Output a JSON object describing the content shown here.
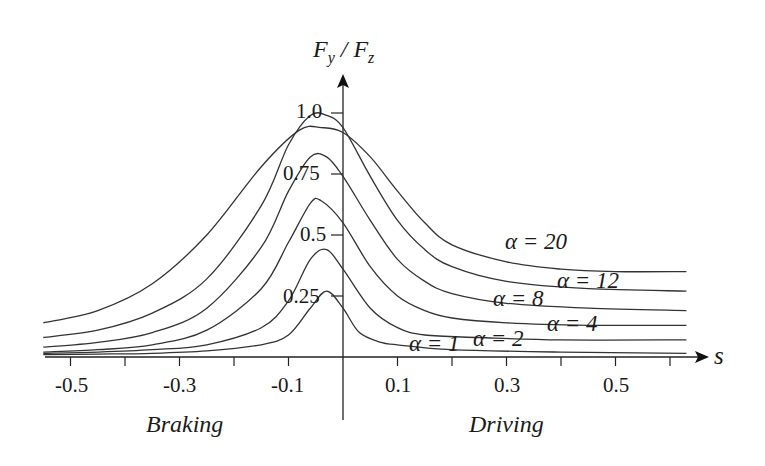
{
  "chart_data": {
    "type": "line",
    "title": "",
    "xlabel": "s",
    "ylabel": "F_y / F_z",
    "xlim": [
      -0.56,
      0.63
    ],
    "ylim": [
      0,
      1.1
    ],
    "grid": false,
    "x_ticks": [
      -0.5,
      -0.4,
      -0.3,
      -0.2,
      -0.1,
      0.1,
      0.2,
      0.3,
      0.4,
      0.5,
      0.6
    ],
    "x_tick_labels": [
      "-0.5",
      "-0.3",
      "-0.1",
      "0.1",
      "0.3",
      "0.5"
    ],
    "y_ticks": [
      0.25,
      0.5,
      0.75,
      1.0
    ],
    "y_tick_labels": [
      "0.25",
      "0.5",
      "0.75",
      "1.0"
    ],
    "region_labels": {
      "left": "Braking",
      "right": "Driving"
    },
    "series": [
      {
        "name": "α = 20",
        "label": "α = 20",
        "points": [
          [
            -0.55,
            0.14
          ],
          [
            -0.45,
            0.19
          ],
          [
            -0.35,
            0.3
          ],
          [
            -0.25,
            0.5
          ],
          [
            -0.15,
            0.78
          ],
          [
            -0.08,
            0.93
          ],
          [
            -0.04,
            0.94
          ],
          [
            0.0,
            0.92
          ],
          [
            0.05,
            0.82
          ],
          [
            0.1,
            0.68
          ],
          [
            0.15,
            0.55
          ],
          [
            0.2,
            0.46
          ],
          [
            0.3,
            0.39
          ],
          [
            0.4,
            0.36
          ],
          [
            0.5,
            0.35
          ],
          [
            0.63,
            0.35
          ]
        ]
      },
      {
        "name": "α = 12",
        "label": "α = 12",
        "points": [
          [
            -0.55,
            0.08
          ],
          [
            -0.45,
            0.11
          ],
          [
            -0.35,
            0.18
          ],
          [
            -0.25,
            0.32
          ],
          [
            -0.15,
            0.62
          ],
          [
            -0.1,
            0.87
          ],
          [
            -0.06,
            0.99
          ],
          [
            -0.03,
            0.99
          ],
          [
            0.0,
            0.94
          ],
          [
            0.05,
            0.74
          ],
          [
            0.1,
            0.56
          ],
          [
            0.15,
            0.44
          ],
          [
            0.2,
            0.37
          ],
          [
            0.3,
            0.31
          ],
          [
            0.45,
            0.28
          ],
          [
            0.63,
            0.27
          ]
        ]
      },
      {
        "name": "α = 8",
        "label": "α = 8",
        "points": [
          [
            -0.55,
            0.04
          ],
          [
            -0.45,
            0.06
          ],
          [
            -0.35,
            0.1
          ],
          [
            -0.25,
            0.2
          ],
          [
            -0.15,
            0.45
          ],
          [
            -0.1,
            0.68
          ],
          [
            -0.06,
            0.82
          ],
          [
            -0.03,
            0.82
          ],
          [
            0.0,
            0.74
          ],
          [
            0.05,
            0.56
          ],
          [
            0.1,
            0.4
          ],
          [
            0.15,
            0.31
          ],
          [
            0.2,
            0.26
          ],
          [
            0.3,
            0.22
          ],
          [
            0.45,
            0.2
          ],
          [
            0.63,
            0.19
          ]
        ]
      },
      {
        "name": "α = 4",
        "label": "α = 4",
        "points": [
          [
            -0.55,
            0.02
          ],
          [
            -0.45,
            0.03
          ],
          [
            -0.35,
            0.05
          ],
          [
            -0.25,
            0.11
          ],
          [
            -0.15,
            0.28
          ],
          [
            -0.1,
            0.47
          ],
          [
            -0.06,
            0.63
          ],
          [
            -0.04,
            0.64
          ],
          [
            0.0,
            0.55
          ],
          [
            0.05,
            0.37
          ],
          [
            0.1,
            0.25
          ],
          [
            0.15,
            0.19
          ],
          [
            0.2,
            0.16
          ],
          [
            0.3,
            0.14
          ],
          [
            0.45,
            0.13
          ],
          [
            0.63,
            0.13
          ]
        ]
      },
      {
        "name": "α = 2",
        "label": "α = 2",
        "points": [
          [
            -0.55,
            0.015
          ],
          [
            -0.45,
            0.02
          ],
          [
            -0.35,
            0.03
          ],
          [
            -0.25,
            0.05
          ],
          [
            -0.15,
            0.12
          ],
          [
            -0.1,
            0.23
          ],
          [
            -0.06,
            0.4
          ],
          [
            -0.03,
            0.44
          ],
          [
            0.0,
            0.36
          ],
          [
            0.05,
            0.2
          ],
          [
            0.1,
            0.12
          ],
          [
            0.15,
            0.09
          ],
          [
            0.25,
            0.08
          ],
          [
            0.4,
            0.07
          ],
          [
            0.63,
            0.07
          ]
        ]
      },
      {
        "name": "α = 1",
        "label": "α = 1",
        "points": [
          [
            -0.55,
            0.01
          ],
          [
            -0.45,
            0.012
          ],
          [
            -0.35,
            0.015
          ],
          [
            -0.25,
            0.025
          ],
          [
            -0.15,
            0.05
          ],
          [
            -0.1,
            0.09
          ],
          [
            -0.06,
            0.2
          ],
          [
            -0.03,
            0.27
          ],
          [
            0.0,
            0.2
          ],
          [
            0.03,
            0.1
          ],
          [
            0.07,
            0.06
          ],
          [
            0.1,
            0.05
          ],
          [
            0.2,
            0.03
          ],
          [
            0.4,
            0.02
          ],
          [
            0.63,
            0.015
          ]
        ]
      }
    ],
    "annotations": [
      {
        "text": "α = 20",
        "x": 0.28,
        "y": 0.47
      },
      {
        "text": "α = 12",
        "x": 0.39,
        "y": 0.3
      },
      {
        "text": "α = 8",
        "x": 0.27,
        "y": 0.23
      },
      {
        "text": "α = 4",
        "x": 0.36,
        "y": 0.12
      },
      {
        "text": "α = 2",
        "x": 0.24,
        "y": 0.08
      },
      {
        "text": "α = 1",
        "x": 0.12,
        "y": 0.05
      }
    ]
  },
  "axis": {
    "y_label_main": "F",
    "y_label_sub1": "y",
    "y_label_sep": " / F",
    "y_label_sub2": "z",
    "x_label": "s"
  },
  "ticks": {
    "x": [
      "-0.5",
      "-0.3",
      "-0.1",
      "0.1",
      "0.3",
      "0.5"
    ],
    "y": [
      "1.0",
      "0.75",
      "0.5",
      "0.25"
    ]
  },
  "regions": {
    "braking": "Braking",
    "driving": "Driving"
  },
  "curve_labels": {
    "a20": "α = 20",
    "a12": "α = 12",
    "a8": "α = 8",
    "a4": "α = 4",
    "a2": "α = 2",
    "a1": "α = 1"
  }
}
